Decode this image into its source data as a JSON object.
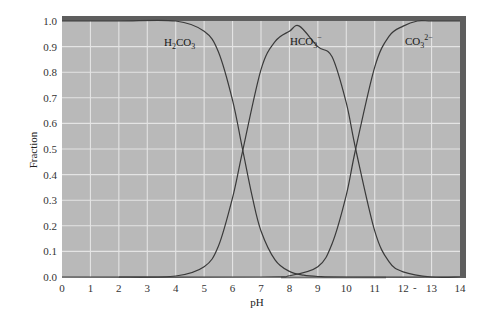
{
  "chart_data": {
    "type": "line",
    "title": "",
    "xlabel": "pH",
    "ylabel": "Fraction",
    "xlim": [
      0,
      14
    ],
    "ylim": [
      0.0,
      1.0
    ],
    "x_ticks": [
      "0",
      "1",
      "2",
      "3",
      "4",
      "5",
      "6",
      "7",
      "8",
      "9",
      "10",
      "11",
      "12",
      "13",
      "14"
    ],
    "y_ticks": [
      "0.0",
      "0.1",
      "0.2",
      "0.3",
      "0.4",
      "0.5",
      "0.6",
      "0.7",
      "0.8",
      "0.9",
      "1.0"
    ],
    "grid": true,
    "legend": "inline labels",
    "pKa1": 6.35,
    "pKa2": 10.33,
    "series": [
      {
        "name": "H2CO3",
        "label_main": "H",
        "label_sub1": "2",
        "label_mid": "CO",
        "label_sub2": "3",
        "label_sup": "",
        "x": [
          0,
          2,
          4,
          5,
          5.5,
          6,
          6.35,
          6.7,
          7,
          7.5,
          8,
          8.5,
          9,
          10,
          14
        ],
        "values": [
          1.0,
          1.0,
          1.0,
          0.96,
          0.88,
          0.69,
          0.5,
          0.31,
          0.18,
          0.066,
          0.022,
          0.007,
          0.002,
          0.0,
          0.0
        ]
      },
      {
        "name": "HCO3-",
        "label_main": "HCO",
        "label_sub": "3",
        "label_sup": "−",
        "x": [
          2,
          4,
          5,
          5.5,
          6,
          6.35,
          7,
          7.5,
          8,
          8.35,
          9,
          9.5,
          10,
          10.33,
          11,
          11.5,
          12,
          13,
          14
        ],
        "values": [
          0.0,
          0.004,
          0.04,
          0.12,
          0.31,
          0.49,
          0.81,
          0.92,
          0.96,
          0.98,
          0.9,
          0.86,
          0.68,
          0.5,
          0.18,
          0.06,
          0.02,
          0.0,
          0.0
        ]
      },
      {
        "name": "CO3 2-",
        "label_main": "CO",
        "label_sub": "3",
        "label_sup": "2−",
        "x": [
          0,
          7,
          8,
          9,
          9.5,
          10,
          10.33,
          11,
          11.5,
          12,
          12.5,
          13,
          14
        ],
        "values": [
          0.0,
          0.0,
          0.005,
          0.04,
          0.13,
          0.32,
          0.5,
          0.82,
          0.94,
          0.98,
          1.0,
          1.0,
          1.0
        ]
      }
    ],
    "annotations": [
      "12 ~ 13 tick separator mark"
    ]
  },
  "labels": {
    "x_axis": "pH",
    "y_axis": "Fraction",
    "stray_mark": "-"
  },
  "colors": {
    "plot_bg": "#b9b9b9",
    "grid": "#e4e4e4",
    "curve": "#3a3a3a",
    "frame_dark": "#5a5a5a",
    "page_bg": "#ffffff"
  }
}
